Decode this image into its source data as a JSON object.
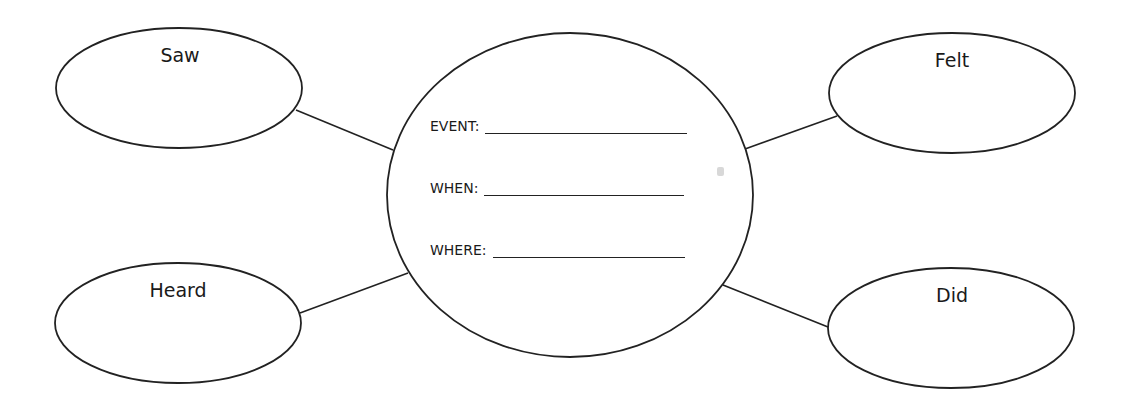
{
  "diagram": {
    "type": "web-organizer",
    "center": {
      "fields": [
        {
          "label": "EVENT:",
          "value": ""
        },
        {
          "label": "WHEN:",
          "value": ""
        },
        {
          "label": "WHERE:",
          "value": ""
        }
      ]
    },
    "nodes": [
      {
        "id": "saw",
        "label": "Saw"
      },
      {
        "id": "heard",
        "label": "Heard"
      },
      {
        "id": "felt",
        "label": "Felt"
      },
      {
        "id": "did",
        "label": "Did"
      }
    ],
    "colors": {
      "stroke": "#222222",
      "background": "#ffffff",
      "text": "#1a1a1a"
    }
  }
}
